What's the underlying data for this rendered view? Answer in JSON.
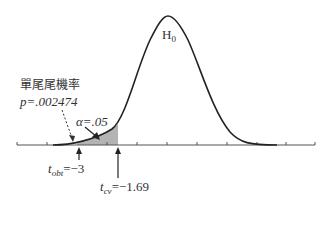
{
  "diagram": {
    "curve_label": "H",
    "curve_label_sub": "0",
    "pvalue_title": "單尾尾機率",
    "pvalue_label": "p=.002474",
    "alpha_label": "α=.05",
    "t_obt_symbol": "t",
    "t_obt_sub": "obt",
    "t_obt_value": "=−3",
    "t_cv_symbol": "t",
    "t_cv_sub": "cv",
    "t_cv_value": "=−1.69",
    "colors": {
      "curve": "#222222",
      "shade": "#b3b3b3",
      "axis": "#444444",
      "text": "#333333"
    }
  }
}
